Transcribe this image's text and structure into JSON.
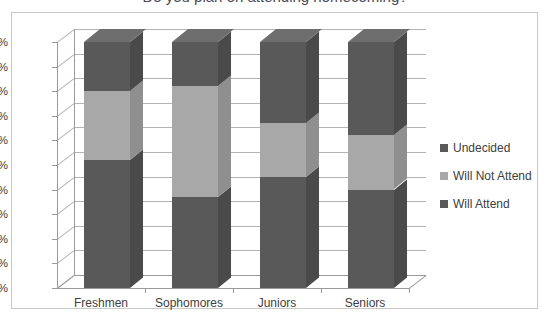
{
  "title_sliver": "Do you plan on attending homecoming?",
  "chart_data": {
    "type": "bar",
    "stacked": true,
    "percent_stacked": true,
    "title": "",
    "xlabel": "",
    "ylabel": "",
    "ylim": [
      0,
      100
    ],
    "ytick_labels": [
      "0%",
      "10%",
      "20%",
      "30%",
      "40%",
      "50%",
      "60%",
      "70%",
      "80%",
      "90%",
      "100%"
    ],
    "ytick_values": [
      0,
      10,
      20,
      30,
      40,
      50,
      60,
      70,
      80,
      90,
      100
    ],
    "grid": true,
    "legend_position": "right",
    "three_d": true,
    "categories": [
      "Freshmen",
      "Sophomores",
      "Juniors",
      "Seniors"
    ],
    "series": [
      {
        "name": "Will Attend",
        "color": "#595959",
        "values": [
          52,
          37,
          45,
          40
        ]
      },
      {
        "name": "Will Not Attend",
        "color": "#a8a8a8",
        "values": [
          28,
          45,
          22,
          22
        ]
      },
      {
        "name": "Undecided",
        "color": "#595959",
        "values": [
          20,
          18,
          33,
          38
        ]
      }
    ]
  },
  "legend": {
    "items": [
      {
        "label": "Undecided",
        "color": "#595959"
      },
      {
        "label": "Will Not Attend",
        "color": "#a8a8a8"
      },
      {
        "label": "Will Attend",
        "color": "#595959"
      }
    ]
  },
  "colors": {
    "dark": "#595959",
    "dark_side": "#4a4a4a",
    "dark_top": "#6e6e6e",
    "light": "#a8a8a8",
    "light_side": "#8f8f8f",
    "light_top": "#bdbdbd",
    "axis": "#9a9a9a",
    "grid": "#b4b4b4",
    "frame": "#c8c8c8",
    "text": "#404040"
  }
}
